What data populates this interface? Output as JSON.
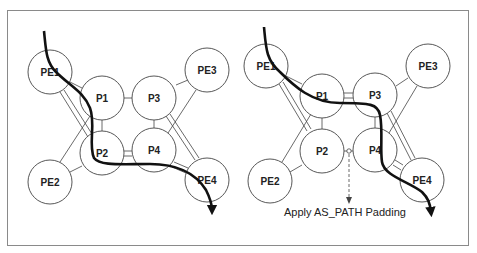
{
  "diagram": {
    "left_panel": {
      "nodes": [
        {
          "id": "PE1",
          "label": "PE1",
          "cx": 50,
          "cy": 72,
          "r": 22
        },
        {
          "id": "P1",
          "label": "P1",
          "cx": 102,
          "cy": 98,
          "r": 22
        },
        {
          "id": "P3",
          "label": "P3",
          "cx": 154,
          "cy": 98,
          "r": 22
        },
        {
          "id": "PE3",
          "label": "PE3",
          "cx": 207,
          "cy": 70,
          "r": 22
        },
        {
          "id": "P2",
          "label": "P2",
          "cx": 102,
          "cy": 153,
          "r": 22
        },
        {
          "id": "P4",
          "label": "P4",
          "cx": 154,
          "cy": 150,
          "r": 22
        },
        {
          "id": "PE2",
          "label": "PE2",
          "cx": 50,
          "cy": 182,
          "r": 22
        },
        {
          "id": "PE4",
          "label": "PE4",
          "cx": 207,
          "cy": 180,
          "r": 22
        }
      ],
      "path": "PE1 -> P1 -> P2 -> P4 -> PE4"
    },
    "right_panel": {
      "nodes": [
        {
          "id": "PE1",
          "label": "PE1",
          "cx": 266,
          "cy": 66,
          "r": 22
        },
        {
          "id": "P1",
          "label": "P1",
          "cx": 322,
          "cy": 96,
          "r": 22
        },
        {
          "id": "P3",
          "label": "P3",
          "cx": 375,
          "cy": 95,
          "r": 22
        },
        {
          "id": "PE3",
          "label": "PE3",
          "cx": 428,
          "cy": 66,
          "r": 22
        },
        {
          "id": "P2",
          "label": "P2",
          "cx": 322,
          "cy": 151,
          "r": 22
        },
        {
          "id": "P4",
          "label": "P4",
          "cx": 375,
          "cy": 150,
          "r": 22
        },
        {
          "id": "PE2",
          "label": "PE2",
          "cx": 270,
          "cy": 181,
          "r": 22
        },
        {
          "id": "PE4",
          "label": "PE4",
          "cx": 422,
          "cy": 180,
          "r": 22
        }
      ],
      "path": "PE1 -> P1 -> P3 -> P4 -> PE4",
      "annotation": "Apply AS_PATH Padding"
    }
  }
}
